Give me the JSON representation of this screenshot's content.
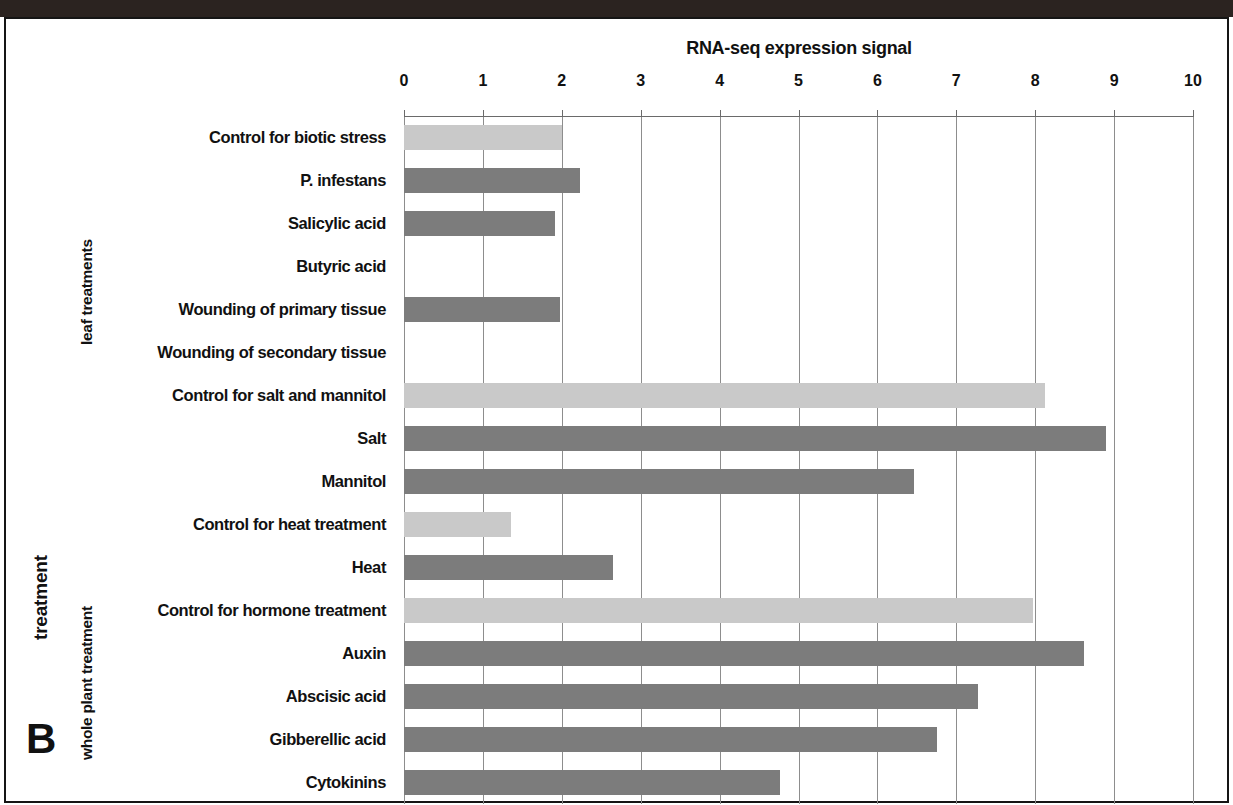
{
  "figure": {
    "panel_letter": "B",
    "axis_title_y": "treatment",
    "group_labels": {
      "leaf": "leaf treatments",
      "whole_plant": "whole plant treatment"
    }
  },
  "colors": {
    "control_bar": "#c9c9c9",
    "treatment_bar": "#7c7c7c",
    "gridline": "#8d8d8d",
    "text": "#111111",
    "scan_band": "#2b2320"
  },
  "chart_data": {
    "type": "bar",
    "orientation": "horizontal",
    "title": "RNA-seq expression signal",
    "xlabel": "RNA-seq expression signal",
    "ylabel": "treatment",
    "xlim": [
      0,
      10
    ],
    "xticks": [
      0,
      1,
      2,
      3,
      4,
      5,
      6,
      7,
      8,
      9,
      10
    ],
    "xtick_labels": [
      "0",
      "1",
      "2",
      "3",
      "4",
      "5",
      "6",
      "7",
      "8",
      "9",
      "10"
    ],
    "grid": true,
    "grid_axis": "x",
    "legend": null,
    "categories": [
      "Control for biotic stress",
      "P. infestans",
      "Salicylic acid",
      "Butyric acid",
      "Wounding of primary tissue",
      "Wounding of secondary tissue",
      "Control for salt and mannitol",
      "Salt",
      "Mannitol",
      "Control for heat treatment",
      "Heat",
      "Control for hormone treatment",
      "Auxin",
      "Abscisic acid",
      "Gibberellic acid",
      "Cytokinins"
    ],
    "values": [
      2.0,
      2.23,
      1.92,
      0.0,
      1.98,
      0.0,
      8.12,
      8.9,
      6.47,
      1.35,
      2.65,
      7.97,
      8.62,
      7.27,
      6.76,
      4.77
    ],
    "bar_kinds": [
      "control",
      "treatment",
      "treatment",
      "treatment",
      "treatment",
      "treatment",
      "control",
      "treatment",
      "treatment",
      "control",
      "treatment",
      "control",
      "treatment",
      "treatment",
      "treatment",
      "treatment"
    ],
    "groups": [
      {
        "label": "leaf treatments",
        "start_index": 0,
        "end_index": 5
      },
      {
        "label": "whole plant treatment",
        "start_index": 6,
        "end_index": 15
      }
    ]
  }
}
